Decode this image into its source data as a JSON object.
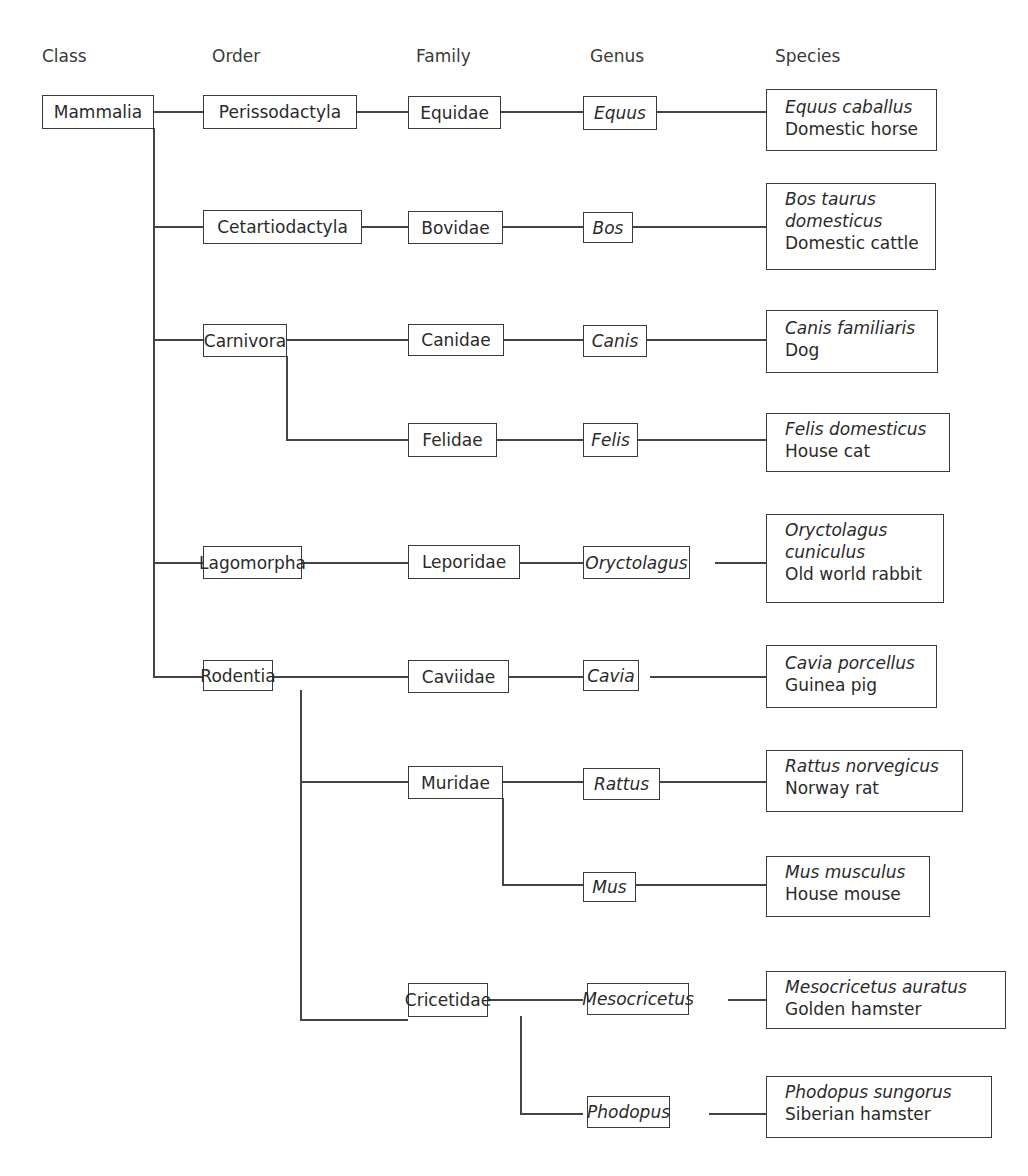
{
  "headers": {
    "class": "Class",
    "order": "Order",
    "family": "Family",
    "genus": "Genus",
    "species": "Species"
  },
  "class_node": {
    "label": "Mammalia"
  },
  "orders": [
    {
      "label": "Perissodactyla"
    },
    {
      "label": "Cetartiodactyla"
    },
    {
      "label": "Carnivora"
    },
    {
      "label": "Lagomorpha"
    },
    {
      "label": "Rodentia"
    }
  ],
  "families": [
    {
      "label": "Equidae",
      "order": "Perissodactyla"
    },
    {
      "label": "Bovidae",
      "order": "Cetartiodactyla"
    },
    {
      "label": "Canidae",
      "order": "Carnivora"
    },
    {
      "label": "Felidae",
      "order": "Carnivora"
    },
    {
      "label": "Leporidae",
      "order": "Lagomorpha"
    },
    {
      "label": "Caviidae",
      "order": "Rodentia"
    },
    {
      "label": "Muridae",
      "order": "Rodentia"
    },
    {
      "label": "Cricetidae",
      "order": "Rodentia"
    }
  ],
  "genera": [
    {
      "label": "Equus",
      "family": "Equidae"
    },
    {
      "label": "Bos",
      "family": "Bovidae"
    },
    {
      "label": "Canis",
      "family": "Canidae"
    },
    {
      "label": "Felis",
      "family": "Felidae"
    },
    {
      "label": "Oryctolagus",
      "family": "Leporidae"
    },
    {
      "label": "Cavia",
      "family": "Caviidae"
    },
    {
      "label": "Rattus",
      "family": "Muridae"
    },
    {
      "label": "Mus",
      "family": "Muridae"
    },
    {
      "label": "Mesocricetus",
      "family": "Cricetidae"
    },
    {
      "label": "Phodopus",
      "family": "Cricetidae"
    }
  ],
  "species": [
    {
      "scientific": [
        "Equus caballus"
      ],
      "common": "Domestic horse"
    },
    {
      "scientific": [
        "Bos taurus",
        "domesticus"
      ],
      "common": "Domestic cattle"
    },
    {
      "scientific": [
        "Canis familiaris"
      ],
      "common": "Dog"
    },
    {
      "scientific": [
        "Felis domesticus"
      ],
      "common": "House cat"
    },
    {
      "scientific": [
        "Oryctolagus",
        "cuniculus"
      ],
      "common": "Old world rabbit"
    },
    {
      "scientific": [
        "Cavia porcellus"
      ],
      "common": "Guinea pig"
    },
    {
      "scientific": [
        "Rattus norvegicus"
      ],
      "common": "Norway rat"
    },
    {
      "scientific": [
        "Mus musculus"
      ],
      "common": "House mouse"
    },
    {
      "scientific": [
        "Mesocricetus auratus"
      ],
      "common": "Golden hamster"
    },
    {
      "scientific": [
        "Phodopus sungorus"
      ],
      "common": "Siberian hamster"
    }
  ],
  "caption": {
    "text": ""
  }
}
